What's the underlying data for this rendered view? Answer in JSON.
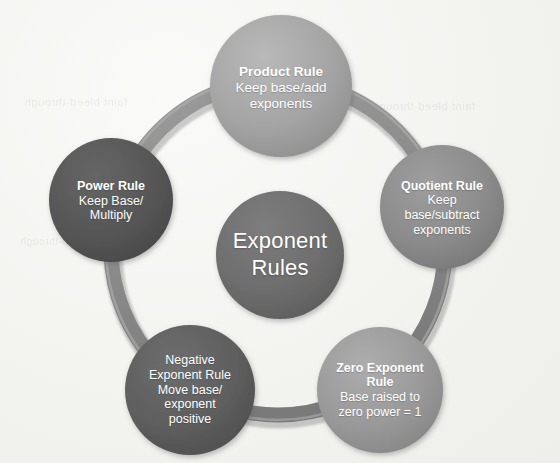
{
  "diagram": {
    "title": "Exponent Rules",
    "type": "cycle-diagram",
    "background_color": "#f2f2ee",
    "center": {
      "name": "center-node",
      "label_line1": "Exponent",
      "label_line2": "Rules",
      "color": "#6f6f6f",
      "text_color": "#ffffff"
    },
    "nodes": [
      {
        "id": "product-rule",
        "title": "Product Rule",
        "title_bold": true,
        "body": [
          "Keep base/add",
          "exponents"
        ],
        "color": "#a6a6a6",
        "text_color": "#ffffff",
        "position": "top"
      },
      {
        "id": "quotient-rule",
        "title": "Quotient Rule",
        "title_bold": true,
        "body": [
          "Keep",
          "base/subtract",
          "exponents"
        ],
        "color": "#8c8c8c",
        "text_color": "#ffffff",
        "position": "right"
      },
      {
        "id": "zero-exponent-rule",
        "title_lines": [
          "Zero Exponent",
          "Rule"
        ],
        "title_bold": true,
        "body": [
          "Base raised to",
          "zero power = 1"
        ],
        "color": "#9a9a9a",
        "text_color": "#ffffff",
        "position": "bottom-right"
      },
      {
        "id": "negative-exponent-rule",
        "title_lines": [
          "Negative",
          "Exponent Rule"
        ],
        "title_bold": false,
        "body": [
          "Move base/",
          "exponent",
          "positive"
        ],
        "color": "#5f5f5f",
        "text_color": "#ffffff",
        "position": "bottom-left"
      },
      {
        "id": "power-rule",
        "title": "Power Rule",
        "title_bold": true,
        "body": [
          "Keep Base/",
          "Multiply"
        ],
        "color": "#565656",
        "text_color": "#ffffff",
        "position": "left"
      }
    ],
    "connector": {
      "name": "cycle-ring",
      "color": "#8e8e8e",
      "shape": "ring"
    },
    "ghost_text": {
      "line1": "faint bleed-through",
      "line2": "faint bleed-through",
      "line3": "faint bleed-through"
    }
  }
}
